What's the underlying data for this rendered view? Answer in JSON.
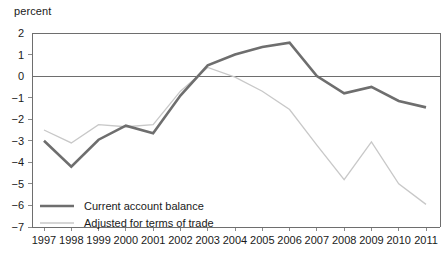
{
  "chart_data": {
    "type": "line",
    "title": "",
    "ylabel": "percent",
    "xlabel": "",
    "ylim": [
      -7,
      2
    ],
    "xlim": [
      "1997",
      "2011"
    ],
    "grid": false,
    "zero_line": true,
    "legend_position": "bottom-left",
    "categories": [
      "1997",
      "1998",
      "1999",
      "2000",
      "2001",
      "2002",
      "2003",
      "2004",
      "2005",
      "2006",
      "2007",
      "2008",
      "2009",
      "2010",
      "2011"
    ],
    "y_ticks": [
      "2",
      "1",
      "0",
      "-1",
      "-2",
      "-3",
      "-4",
      "-5",
      "-6",
      "-7"
    ],
    "y_tick_values": [
      2,
      1,
      0,
      -1,
      -2,
      -3,
      -4,
      -5,
      -6,
      -7
    ],
    "series": [
      {
        "name": "Current account balance",
        "color": "#6e6e6e",
        "width": 2.6,
        "values": [
          -3.0,
          -4.2,
          -2.95,
          -2.3,
          -2.65,
          -0.9,
          0.5,
          1.0,
          1.35,
          1.55,
          0.0,
          -0.8,
          -0.5,
          -1.15,
          -1.45
        ]
      },
      {
        "name": "Adjusted for terms of trade",
        "color": "#c8c8c8",
        "width": 1.3,
        "values": [
          -2.5,
          -3.1,
          -2.25,
          -2.35,
          -2.25,
          -0.7,
          0.4,
          -0.05,
          -0.7,
          -1.55,
          -3.2,
          -4.8,
          -3.05,
          -5.0,
          -5.95
        ]
      }
    ]
  },
  "legend": {
    "items": [
      {
        "label": "Current account balance"
      },
      {
        "label": "Adjusted for terms of trade"
      }
    ]
  }
}
